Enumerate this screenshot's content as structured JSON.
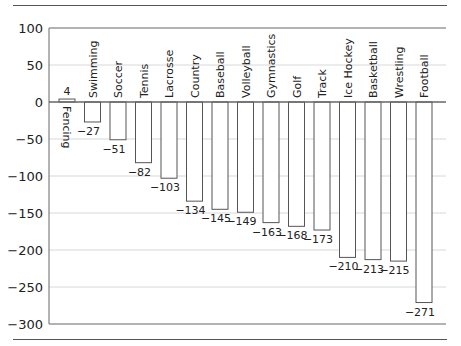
{
  "chart_data": {
    "type": "bar",
    "title": "",
    "xlabel": "",
    "ylabel": "",
    "categories": [
      "Fencing",
      "Swimming",
      "Soccer",
      "Tennis",
      "Lacrosse",
      "Country",
      "Baseball",
      "Volleyball",
      "Gymnastics",
      "Golf",
      "Track",
      "Ice Hockey",
      "Basketball",
      "Wrestling",
      "Football"
    ],
    "values": [
      4,
      -27,
      -51,
      -82,
      -103,
      -134,
      -145,
      -149,
      -163,
      -168,
      -173,
      -210,
      -213,
      -215,
      -271
    ],
    "data_labels": [
      "4",
      "−27",
      "−51",
      "−82",
      "−103",
      "−134",
      "−145",
      "−149",
      "−163",
      "−168",
      "−173",
      "−210",
      "−213",
      "−215",
      "−271"
    ],
    "ylim": [
      -300,
      100
    ],
    "yticks": [
      100,
      50,
      0,
      -50,
      -100,
      -150,
      -200,
      -250,
      -300
    ],
    "ytick_labels": [
      "100",
      "50",
      "0",
      "−50",
      "−100",
      "−150",
      "−200",
      "−250",
      "−300"
    ],
    "grid": true,
    "legend": null
  },
  "colors": {
    "bar_fill": "#ffffff",
    "bar_stroke": "#555555",
    "grid": "#d8d8d8",
    "axis": "#666666"
  }
}
